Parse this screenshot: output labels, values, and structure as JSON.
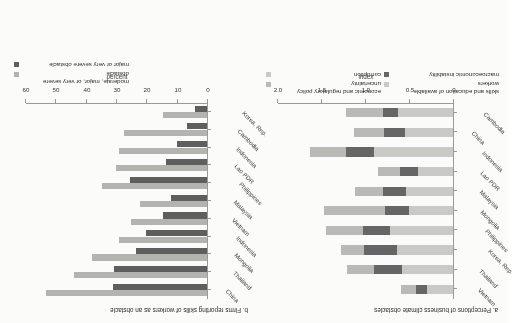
{
  "figure": {
    "orientation": "rotated-180",
    "background": "#fbfbfa"
  },
  "colors": {
    "corruption": "#c9cac6",
    "economic_policy_uncertainty": "#b9bab6",
    "macroeconomic_instability": "#666666",
    "skills_education": "#c9cac6",
    "moderate_major_very_severe": "#b3b4b0",
    "major_very_severe": "#5e5e5e",
    "axis": "#9a9a9a",
    "text": "#2b2b2b"
  },
  "panel_a": {
    "title": "a. Perceptions of business climate obstacles",
    "axis_title": "index",
    "ticks": [
      "0",
      "0.5",
      "1.0",
      "1.5",
      "2.0"
    ],
    "legend": [
      {
        "label": "corruption",
        "color": "#c9cac6"
      },
      {
        "label": "economic and regulatory policy uncertainty",
        "color": "#b9bab6"
      },
      {
        "label": "macroeconomic instability",
        "color": "#666666"
      },
      {
        "label": "skills and education of available workers",
        "color": "#c9cac6"
      }
    ]
  },
  "panel_b": {
    "title": "b. Firms reporting skills of workers as an obstacle",
    "axis_title": "percent",
    "ticks": [
      "0",
      "10",
      "20",
      "30",
      "40",
      "50",
      "60"
    ],
    "legend": [
      {
        "label": "major or very severe obstacle",
        "color": "#5e5e5e"
      },
      {
        "label": "moderate, major, or very severe obstacle",
        "color": "#b3b4b0"
      }
    ]
  },
  "chart_data": [
    {
      "type": "bar",
      "id": "panel-a",
      "title": "a. Perceptions of business climate obstacles",
      "subtitle": "",
      "xlabel": "",
      "ylabel": "index",
      "orientation": "horizontal",
      "stacked": true,
      "xlim": [
        0,
        2.0
      ],
      "grid": false,
      "legend_position": "bottom",
      "categories": [
        "Cambodia",
        "China",
        "Indonesia",
        "Lao PDR",
        "Malaysia",
        "Mongolia",
        "Philippines",
        "Korea, Rep.",
        "Thailand",
        "Vietnam"
      ],
      "series": [
        {
          "name": "corruption",
          "color": "#c9cac6",
          "values": [
            0.62,
            0.55,
            0.9,
            0.4,
            0.53,
            0.5,
            0.72,
            0.64,
            0.58,
            0.3
          ]
        },
        {
          "name": "macroeconomic instability",
          "color": "#666666",
          "values": [
            0.18,
            0.23,
            0.32,
            0.2,
            0.27,
            0.27,
            0.3,
            0.37,
            0.32,
            0.12
          ]
        },
        {
          "name": "economic and regulatory policy uncertainty",
          "color": "#b9bab6",
          "values": [
            0.42,
            0.35,
            0.4,
            0.25,
            0.31,
            0.7,
            0.42,
            0.26,
            0.3,
            0.17
          ]
        }
      ],
      "totals": [
        1.22,
        1.13,
        1.62,
        0.85,
        1.11,
        1.47,
        1.44,
        1.27,
        1.2,
        0.59
      ]
    },
    {
      "type": "bar",
      "id": "panel-b",
      "title": "b. Firms reporting skills of workers as an obstacle",
      "subtitle": "",
      "xlabel": "",
      "ylabel": "percent",
      "orientation": "horizontal",
      "stacked": false,
      "xlim": [
        0,
        60
      ],
      "grid": false,
      "legend_position": "bottom",
      "categories": [
        "Korea, Rep.",
        "Cambodia",
        "Indonesia",
        "Lao PDR",
        "Philippines",
        "Malaysia",
        "Vietnam",
        "Indonesia ",
        "Mongolia",
        "Thailand",
        "China"
      ],
      "series": [
        {
          "name": "moderate, major, or very severe obstacle",
          "color": "#b3b4b0",
          "values": [
            14.5,
            27.5,
            29.0,
            30.0,
            34.5,
            22.0,
            25.0,
            29.0,
            38.0,
            44.0,
            53.0
          ]
        },
        {
          "name": "major or very severe obstacle",
          "color": "#5e5e5e",
          "values": [
            4.0,
            6.5,
            10.0,
            13.5,
            25.5,
            12.0,
            14.5,
            20.0,
            23.5,
            30.5,
            31.0
          ]
        }
      ]
    }
  ]
}
